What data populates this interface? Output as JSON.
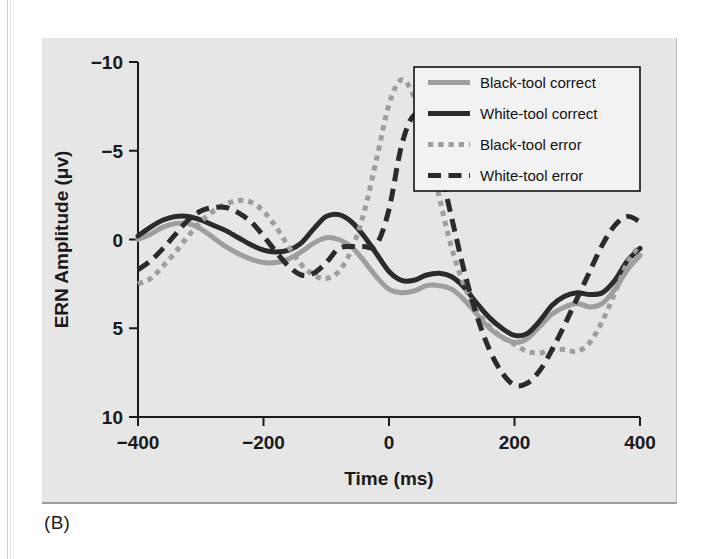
{
  "figure": {
    "caption": "(B)",
    "panel_bg": "#e6e6e6"
  },
  "chart_data": {
    "type": "line",
    "title": "",
    "xlabel": "Time (ms)",
    "ylabel": "ERN Amplitude (μv)",
    "xlim": [
      -400,
      400
    ],
    "ylim": [
      -10,
      10
    ],
    "y_inverted": true,
    "grid": false,
    "xticks": [
      -400,
      -200,
      0,
      200,
      400
    ],
    "xtick_labels": [
      "−400",
      "−200",
      "0",
      "200",
      "400"
    ],
    "yticks": [
      -10,
      -5,
      0,
      5,
      10
    ],
    "ytick_labels": [
      "−10",
      "−5",
      "0",
      "5",
      "10"
    ],
    "legend_position": "top-right",
    "colors": {
      "gray": "#9e9e9e",
      "black": "#2b2b2b",
      "axis": "#1a1a1a"
    },
    "x": [
      -400,
      -380,
      -360,
      -340,
      -320,
      -300,
      -280,
      -260,
      -240,
      -220,
      -200,
      -180,
      -160,
      -140,
      -120,
      -100,
      -80,
      -60,
      -40,
      -20,
      0,
      20,
      40,
      60,
      80,
      100,
      120,
      140,
      160,
      180,
      200,
      220,
      240,
      260,
      280,
      300,
      320,
      340,
      360,
      380,
      400
    ],
    "series": [
      {
        "name": "Black-tool correct",
        "style": "solid",
        "color": "#9e9e9e",
        "width": 5,
        "values": [
          0.0,
          -0.3,
          -0.7,
          -0.9,
          -0.9,
          -0.6,
          -0.1,
          0.4,
          0.8,
          1.1,
          1.3,
          1.3,
          1.1,
          0.7,
          0.2,
          -0.1,
          0.0,
          0.4,
          1.2,
          2.1,
          2.8,
          3.0,
          2.9,
          2.6,
          2.6,
          2.8,
          3.4,
          4.2,
          5.0,
          5.5,
          5.8,
          5.6,
          4.9,
          4.2,
          3.8,
          3.6,
          3.8,
          3.6,
          2.8,
          1.7,
          0.9
        ]
      },
      {
        "name": "White-tool correct",
        "style": "solid",
        "color": "#2b2b2b",
        "width": 5,
        "values": [
          -0.2,
          -0.7,
          -1.1,
          -1.3,
          -1.3,
          -1.1,
          -0.8,
          -0.5,
          -0.1,
          0.3,
          0.6,
          0.7,
          0.6,
          0.2,
          -0.6,
          -1.3,
          -1.4,
          -1.0,
          -0.2,
          0.8,
          1.8,
          2.3,
          2.3,
          2.0,
          1.9,
          2.1,
          2.7,
          3.6,
          4.4,
          5.0,
          5.4,
          5.3,
          4.6,
          3.7,
          3.2,
          3.0,
          3.1,
          3.0,
          2.3,
          1.2,
          0.5
        ]
      },
      {
        "name": "Black-tool error",
        "style": "dotted",
        "color": "#9e9e9e",
        "width": 5,
        "values": [
          2.5,
          2.2,
          1.5,
          0.7,
          -0.2,
          -1.0,
          -1.6,
          -2.0,
          -2.2,
          -2.1,
          -1.6,
          -0.7,
          0.4,
          1.4,
          2.0,
          2.2,
          1.8,
          0.6,
          -1.5,
          -4.5,
          -7.6,
          -9.0,
          -8.0,
          -5.5,
          -2.4,
          0.5,
          2.6,
          4.0,
          4.9,
          5.5,
          5.9,
          6.3,
          6.4,
          6.2,
          6.2,
          6.3,
          5.8,
          4.6,
          3.0,
          1.3,
          0.3
        ]
      },
      {
        "name": "White-tool error",
        "style": "dashed",
        "color": "#2b2b2b",
        "width": 5,
        "values": [
          1.7,
          1.2,
          0.5,
          -0.3,
          -1.1,
          -1.6,
          -1.8,
          -1.8,
          -1.5,
          -1.0,
          -0.2,
          0.7,
          1.5,
          2.0,
          1.9,
          1.3,
          0.5,
          0.4,
          0.4,
          0.3,
          -1.7,
          -5.3,
          -7.0,
          -6.4,
          -4.2,
          -1.2,
          1.8,
          4.3,
          6.2,
          7.5,
          8.2,
          8.1,
          7.4,
          6.2,
          4.8,
          3.3,
          1.8,
          0.3,
          -0.8,
          -1.3,
          -1.0
        ]
      }
    ],
    "legend": [
      {
        "label": "Black-tool correct",
        "style": "solid",
        "color": "#9e9e9e"
      },
      {
        "label": "White-tool correct",
        "style": "solid",
        "color": "#2b2b2b"
      },
      {
        "label": "Black-tool error",
        "style": "dotted",
        "color": "#9e9e9e"
      },
      {
        "label": "White-tool error",
        "style": "dashed",
        "color": "#2b2b2b"
      }
    ]
  }
}
